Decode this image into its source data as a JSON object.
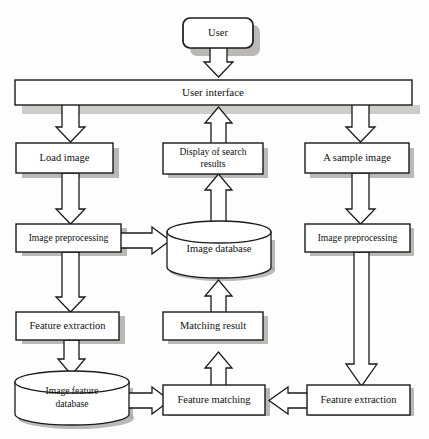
{
  "diagram": {
    "type": "flowchart",
    "colors": {
      "box_fill": "#ffffff",
      "box_stroke": "#1a1a1a",
      "shadow": "#a8a5a0",
      "background": "#fdfdfd"
    },
    "nodes": [
      {
        "id": "user",
        "label": "User",
        "shape": "rounded-rect"
      },
      {
        "id": "user-interface",
        "label": "User interface",
        "shape": "rect-wide"
      },
      {
        "id": "load-image",
        "label": "Load image",
        "shape": "rect"
      },
      {
        "id": "display-results",
        "label": "Display of search",
        "label2": "results",
        "shape": "rect"
      },
      {
        "id": "sample-image",
        "label": "A sample image",
        "shape": "rect"
      },
      {
        "id": "preprocess-left",
        "label": "Image preprocessing",
        "shape": "rect"
      },
      {
        "id": "image-database",
        "label": "Image database",
        "shape": "cylinder"
      },
      {
        "id": "preprocess-right",
        "label": "Image preprocessing",
        "shape": "rect"
      },
      {
        "id": "feature-extract-left",
        "label": "Feature extraction",
        "shape": "rect"
      },
      {
        "id": "matching-result",
        "label": "Matching result",
        "shape": "rect"
      },
      {
        "id": "feature-db",
        "label": "Image feature",
        "label2": "database",
        "shape": "cylinder"
      },
      {
        "id": "feature-matching",
        "label": "Feature matching",
        "shape": "rect"
      },
      {
        "id": "feature-extract-right",
        "label": "Feature extraction",
        "shape": "rect"
      }
    ],
    "edges": [
      {
        "from": "user",
        "to": "user-interface",
        "direction": "down"
      },
      {
        "from": "user-interface",
        "to": "load-image",
        "direction": "down"
      },
      {
        "from": "display-results",
        "to": "user-interface",
        "direction": "up"
      },
      {
        "from": "user-interface",
        "to": "sample-image",
        "direction": "down"
      },
      {
        "from": "load-image",
        "to": "preprocess-left",
        "direction": "down"
      },
      {
        "from": "image-database",
        "to": "display-results",
        "direction": "up"
      },
      {
        "from": "sample-image",
        "to": "preprocess-right",
        "direction": "down"
      },
      {
        "from": "preprocess-left",
        "to": "image-database",
        "direction": "right"
      },
      {
        "from": "preprocess-left",
        "to": "feature-extract-left",
        "direction": "down"
      },
      {
        "from": "matching-result",
        "to": "image-database",
        "direction": "up"
      },
      {
        "from": "feature-extract-left",
        "to": "feature-db",
        "direction": "down"
      },
      {
        "from": "feature-matching",
        "to": "matching-result",
        "direction": "up"
      },
      {
        "from": "preprocess-right",
        "to": "feature-extract-right",
        "direction": "down"
      },
      {
        "from": "feature-db",
        "to": "feature-matching",
        "direction": "right"
      },
      {
        "from": "feature-extract-right",
        "to": "feature-matching",
        "direction": "left"
      }
    ]
  }
}
